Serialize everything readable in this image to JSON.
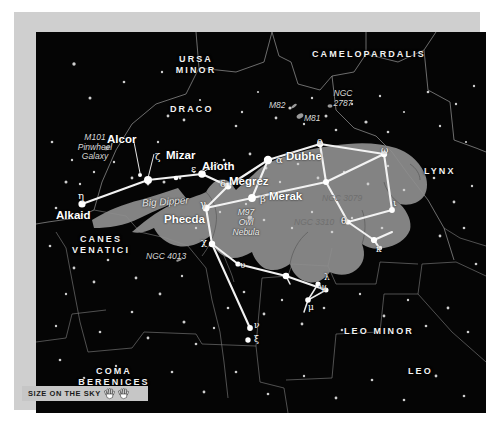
{
  "chart": {
    "background_color": "#050505",
    "frame_color": "#cfcfcf",
    "silhouette_color": "#8e8e8e",
    "asterism_color": "#f2f2f2"
  },
  "scale": {
    "label": "SIZE ON THE SKY",
    "icon_left": "open-hand-icon",
    "icon_right": "open-hand-icon",
    "hands": 2
  },
  "constellations": [
    {
      "name": "URSA\nMINOR",
      "line1": "URSA",
      "line2": "MINOR"
    },
    {
      "name": "DRACO",
      "line1": "DRACO",
      "line2": ""
    },
    {
      "name": "CAMELOPARDALIS",
      "line1": "CAMELOPARDALIS",
      "line2": ""
    },
    {
      "name": "LYNX",
      "line1": "LYNX",
      "line2": ""
    },
    {
      "name": "CANES\nVENATICI",
      "line1": "CANES",
      "line2": "VENATICI"
    },
    {
      "name": "COMA\nBERENICES",
      "line1": "COMA",
      "line2": "BERENICES"
    },
    {
      "name": "LEO MINOR",
      "line1": "LEO MINOR",
      "line2": ""
    },
    {
      "name": "LEO",
      "line1": "LEO",
      "line2": ""
    }
  ],
  "named_stars": [
    {
      "name": "Alcor",
      "greek": ""
    },
    {
      "name": "Mizar",
      "greek": "ζ"
    },
    {
      "name": "Alioth",
      "greek": "ε"
    },
    {
      "name": "Megrez",
      "greek": "δ"
    },
    {
      "name": "Dubhe",
      "greek": "α"
    },
    {
      "name": "Merak",
      "greek": "β"
    },
    {
      "name": "Phecda",
      "greek": "γ"
    },
    {
      "name": "Alkaid",
      "greek": "η"
    }
  ],
  "greek_labels": [
    {
      "glyph": "η",
      "role": "eta-alkaid"
    },
    {
      "glyph": "ζ",
      "role": "zeta-mizar"
    },
    {
      "glyph": "ε",
      "role": "epsilon-alioth"
    },
    {
      "glyph": "δ",
      "role": "delta-megrez"
    },
    {
      "glyph": "α",
      "role": "alpha-dubhe"
    },
    {
      "glyph": "β",
      "role": "beta-merak"
    },
    {
      "glyph": "γ",
      "role": "gamma-phecda"
    },
    {
      "glyph": "χ",
      "role": "chi"
    },
    {
      "glyph": "ψ",
      "role": "psi"
    },
    {
      "glyph": "ν",
      "role": "nu"
    },
    {
      "glyph": "ξ",
      "role": "xi"
    },
    {
      "glyph": "λ",
      "role": "lambda"
    },
    {
      "glyph": "μ",
      "role": "mu"
    },
    {
      "glyph": "ω",
      "role": "omega"
    },
    {
      "glyph": "ο",
      "role": "omicron"
    },
    {
      "glyph": "υ",
      "role": "upsilon"
    },
    {
      "glyph": "θ",
      "role": "theta"
    },
    {
      "glyph": "ι",
      "role": "iota"
    },
    {
      "glyph": "κ",
      "role": "kappa"
    }
  ],
  "deep_sky": [
    {
      "label": "M101\nPinwheel\nGalaxy",
      "l1": "M101",
      "l2": "Pinwheel",
      "l3": "Galaxy"
    },
    {
      "label": "M82",
      "l1": "M82",
      "l2": "",
      "l3": ""
    },
    {
      "label": "M81",
      "l1": "M81",
      "l2": "",
      "l3": ""
    },
    {
      "label": "NGC\n2787",
      "l1": "NGC",
      "l2": "2787",
      "l3": ""
    },
    {
      "label": "M97\nOwl\nNebula",
      "l1": "M97",
      "l2": "Owl",
      "l3": "Nebula"
    },
    {
      "label": "NGC 3079",
      "l1": "NGC 3079",
      "l2": "",
      "l3": ""
    },
    {
      "label": "NGC 3310",
      "l1": "NGC 3310",
      "l2": "",
      "l3": ""
    },
    {
      "label": "NGC 4013",
      "l1": "NGC 4013",
      "l2": "",
      "l3": ""
    }
  ],
  "asterism": {
    "label": "Big Dipper"
  }
}
